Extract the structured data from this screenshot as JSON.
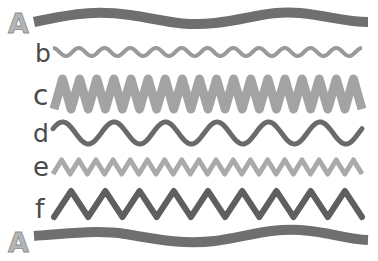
{
  "diagram": {
    "title": "",
    "rows": [
      {
        "id": "A-top",
        "label": "A",
        "color": "#6f6f6f",
        "cycles": 1.5,
        "amplitude": 5,
        "stroke_width": 10,
        "shape": "smooth",
        "y_center": 19
      },
      {
        "id": "b",
        "label": "b",
        "color": "#9a9a9a",
        "cycles": 12,
        "amplitude": 4,
        "stroke_width": 4,
        "shape": "smooth",
        "y_center": 52
      },
      {
        "id": "c",
        "label": "c",
        "color": "#a3a3a3",
        "cycles": 18,
        "amplitude": 15,
        "stroke_width": 9,
        "shape": "zigzag",
        "y_center": 94
      },
      {
        "id": "d",
        "label": "d",
        "color": "#6a6a6a",
        "cycles": 6,
        "amplitude": 11,
        "stroke_width": 5,
        "shape": "smooth",
        "y_center": 133
      },
      {
        "id": "e",
        "label": "e",
        "color": "#aaaaaa",
        "cycles": 18,
        "amplitude": 7,
        "stroke_width": 5,
        "shape": "smooth-sharp",
        "y_center": 167
      },
      {
        "id": "f",
        "label": "f",
        "color": "#5f5f5f",
        "cycles": 9,
        "amplitude": 13,
        "stroke_width": 6,
        "shape": "zigzag",
        "y_center": 204
      },
      {
        "id": "A-bottom",
        "label": "A",
        "color": "#6f6f6f",
        "cycles": 1.5,
        "amplitude": 5,
        "stroke_width": 10,
        "shape": "smooth",
        "y_center": 237
      }
    ]
  }
}
